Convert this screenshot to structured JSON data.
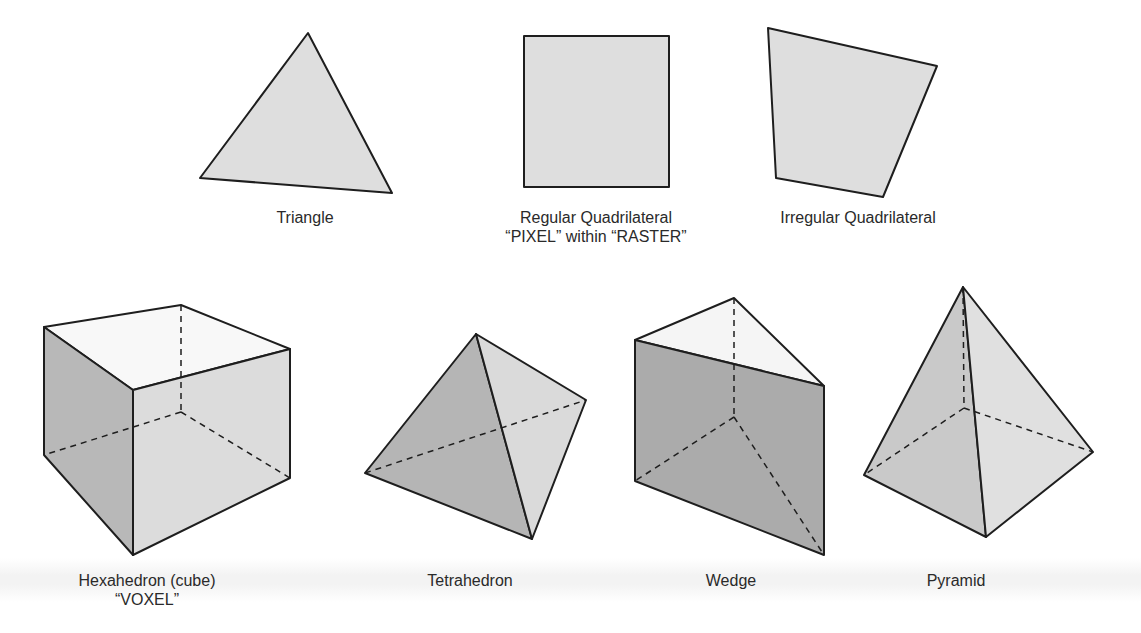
{
  "figure": {
    "colors": {
      "stroke": "#1e1e1e",
      "face_light": "#ebebeb",
      "face_mid": "#d6d6d6",
      "face_dark": "#b3b3b3",
      "face_top": "#f7f7f7"
    },
    "shapes_2d": [
      {
        "id": "triangle",
        "label": "Triangle",
        "sublabel": "",
        "points": [
          [
            308,
            33
          ],
          [
            392,
            193
          ],
          [
            200,
            178
          ]
        ]
      },
      {
        "id": "regular-quadrilateral",
        "label": "Regular Quadrilateral",
        "sublabel": "“PIXEL” within “RASTER”",
        "points": [
          [
            524,
            36
          ],
          [
            669,
            36
          ],
          [
            669,
            187
          ],
          [
            524,
            187
          ]
        ]
      },
      {
        "id": "irregular-quadrilateral",
        "label": "Irregular Quadrilateral",
        "sublabel": "",
        "points": [
          [
            768,
            28
          ],
          [
            937,
            66
          ],
          [
            883,
            197
          ],
          [
            776,
            178
          ]
        ]
      }
    ],
    "shapes_3d": [
      {
        "id": "hexahedron",
        "label": "Hexahedron (cube)",
        "sublabel": "“VOXEL”"
      },
      {
        "id": "tetrahedron",
        "label": "Tetrahedron",
        "sublabel": ""
      },
      {
        "id": "wedge",
        "label": "Wedge",
        "sublabel": ""
      },
      {
        "id": "pyramid",
        "label": "Pyramid",
        "sublabel": ""
      }
    ]
  }
}
